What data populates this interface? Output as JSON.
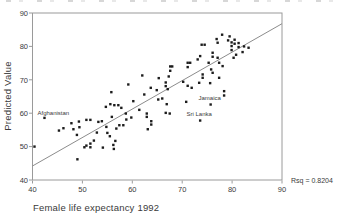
{
  "chart_data": {
    "type": "scatter",
    "title": "",
    "xlabel": "Female life expectancy 1992",
    "ylabel": "Predicted Value",
    "rsq_label": "Rsq = 0.8204",
    "xlim": [
      40,
      90
    ],
    "ylim": [
      40,
      90
    ],
    "x_ticks": [
      40,
      50,
      60,
      70,
      80,
      90
    ],
    "y_ticks": [
      40,
      50,
      60,
      70,
      80,
      90
    ],
    "grid": false,
    "legend": "none",
    "marker": "small-black-square",
    "point_color": "#1c1c1c",
    "line_color": "#8c8c8c",
    "frame_color": "#9a9a9a",
    "text_color": "#3a3a3a",
    "fit_line": {
      "x1": 40,
      "y1": 44.2,
      "x2": 90,
      "y2": 86.8
    },
    "labeled_points": [
      {
        "label": "Afghanistan",
        "x": 42.4,
        "y": 58.6,
        "anchor": "start",
        "dx": -7,
        "dy": -3
      },
      {
        "label": "Jamaica",
        "x": 75.7,
        "y": 62.6,
        "anchor": "middle",
        "dx": -1,
        "dy": -4.5
      },
      {
        "label": "Sri Lanka",
        "x": 73.6,
        "y": 57.8,
        "anchor": "middle",
        "dx": -1,
        "dy": -4.5
      }
    ],
    "points": [
      [
        40.4,
        50.0
      ],
      [
        45.3,
        54.8
      ],
      [
        46.2,
        55.5
      ],
      [
        47.8,
        57.0
      ],
      [
        48.2,
        55.2
      ],
      [
        48.9,
        53.5
      ],
      [
        49.3,
        57.5
      ],
      [
        49.4,
        55.8
      ],
      [
        50.8,
        58.0
      ],
      [
        51.6,
        58.0
      ],
      [
        50.4,
        49.8
      ],
      [
        50.8,
        50.3
      ],
      [
        51.6,
        50.9
      ],
      [
        51.6,
        49.8
      ],
      [
        52.3,
        51.8
      ],
      [
        49.0,
        46.2
      ],
      [
        53.2,
        57.4
      ],
      [
        53.9,
        57.6
      ],
      [
        54.7,
        61.9
      ],
      [
        54.1,
        49.7
      ],
      [
        54.8,
        55.9
      ],
      [
        52.9,
        54.2
      ],
      [
        55.0,
        54.1
      ],
      [
        55.5,
        53.1
      ],
      [
        55.6,
        62.7
      ],
      [
        56.4,
        62.4
      ],
      [
        57.2,
        62.4
      ],
      [
        56.2,
        50.5
      ],
      [
        56.3,
        49.3
      ],
      [
        56.6,
        51.7
      ],
      [
        55.8,
        66.3
      ],
      [
        57.8,
        61.6
      ],
      [
        55.9,
        58.9
      ],
      [
        56.8,
        55.4
      ],
      [
        57.4,
        56.4
      ],
      [
        58.2,
        56.4
      ],
      [
        58.8,
        58.1
      ],
      [
        59.8,
        58.7
      ],
      [
        58.7,
        59.9
      ],
      [
        59.2,
        68.6
      ],
      [
        60.2,
        63.6
      ],
      [
        61.4,
        61.0
      ],
      [
        62.0,
        71.3
      ],
      [
        62.4,
        65.6
      ],
      [
        62.9,
        59.9
      ],
      [
        62.9,
        58.9
      ],
      [
        63.8,
        57.6
      ],
      [
        63.8,
        56.6
      ],
      [
        63.1,
        55.2
      ],
      [
        63.7,
        67.6
      ],
      [
        64.9,
        66.9
      ],
      [
        65.2,
        64.1
      ],
      [
        66.0,
        64.4
      ],
      [
        66.9,
        62.7
      ],
      [
        66.7,
        60.1
      ],
      [
        67.5,
        59.9
      ],
      [
        65.3,
        70.5
      ],
      [
        66.7,
        69.2
      ],
      [
        66.7,
        68.1
      ],
      [
        67.1,
        67.2
      ],
      [
        67.6,
        74.0
      ],
      [
        68.0,
        74.0
      ],
      [
        67.6,
        72.7
      ],
      [
        67.3,
        71.0
      ],
      [
        70.2,
        69.4
      ],
      [
        70.8,
        63.4
      ],
      [
        71.1,
        68.2
      ],
      [
        71.9,
        67.6
      ],
      [
        71.1,
        75.1
      ],
      [
        71.6,
        75.1
      ],
      [
        71.1,
        73.8
      ],
      [
        73.1,
        76.1
      ],
      [
        73.4,
        69.1
      ],
      [
        73.6,
        77.1
      ],
      [
        73.9,
        80.5
      ],
      [
        74.5,
        80.5
      ],
      [
        74.1,
        71.6
      ],
      [
        74.1,
        70.6
      ],
      [
        75.6,
        69.0
      ],
      [
        75.3,
        75.1
      ],
      [
        75.8,
        73.1
      ],
      [
        76.1,
        72.1
      ],
      [
        76.1,
        78.1
      ],
      [
        76.1,
        76.9
      ],
      [
        77.1,
        81.1
      ],
      [
        77.1,
        76.6
      ],
      [
        77.4,
        75.1
      ],
      [
        77.4,
        70.6
      ],
      [
        76.9,
        82.2
      ],
      [
        78.0,
        83.5
      ],
      [
        78.1,
        74.1
      ],
      [
        78.4,
        66.6
      ],
      [
        78.4,
        65.3
      ],
      [
        79.2,
        81.8
      ],
      [
        79.5,
        83.0
      ],
      [
        79.9,
        81.2
      ],
      [
        79.9,
        80.1
      ],
      [
        79.9,
        78.9
      ],
      [
        80.5,
        82.0
      ],
      [
        80.5,
        80.8
      ],
      [
        81.3,
        81.0
      ],
      [
        81.3,
        79.8
      ],
      [
        82.1,
        78.3
      ],
      [
        82.4,
        80.0
      ],
      [
        83.3,
        79.6
      ],
      [
        80.3,
        76.6
      ],
      [
        80.8,
        77.5
      ]
    ]
  }
}
